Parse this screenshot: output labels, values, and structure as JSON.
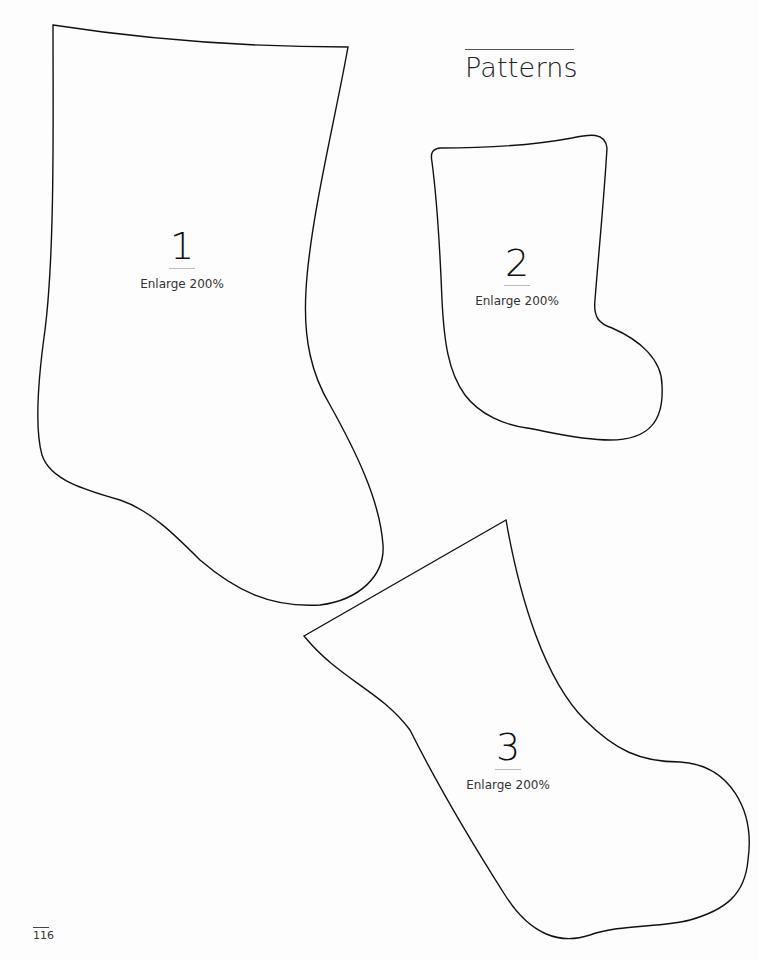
{
  "header": {
    "title": "Patterns"
  },
  "patterns": [
    {
      "number": "1",
      "instruction": "Enlarge 200%"
    },
    {
      "number": "2",
      "instruction": "Enlarge 200%"
    },
    {
      "number": "3",
      "instruction": "Enlarge 200%"
    }
  ],
  "footer": {
    "page_number": "116"
  },
  "colors": {
    "outline": "#111111",
    "background": "#ffffff"
  }
}
